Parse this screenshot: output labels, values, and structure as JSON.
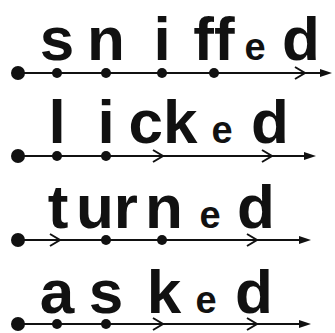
{
  "colors": {
    "ink": "#111111",
    "background": "#ffffff"
  },
  "words": [
    {
      "word": "sniffed",
      "segments": [
        {
          "text": "s",
          "size": "large",
          "marker": "dot"
        },
        {
          "text": "n",
          "size": "large",
          "marker": "dot"
        },
        {
          "text": "i",
          "size": "large",
          "marker": "dot"
        },
        {
          "text": "ff",
          "size": "large",
          "marker": "dot"
        },
        {
          "text": "e",
          "size": "small",
          "marker": "none"
        },
        {
          "text": "d",
          "size": "large",
          "marker": "chevron"
        }
      ]
    },
    {
      "word": "licked",
      "segments": [
        {
          "text": "l",
          "size": "large",
          "marker": "dot"
        },
        {
          "text": "i",
          "size": "large",
          "marker": "dot"
        },
        {
          "text": "ck",
          "size": "large",
          "marker": "chevron"
        },
        {
          "text": "e",
          "size": "small",
          "marker": "none"
        },
        {
          "text": "d",
          "size": "large",
          "marker": "chevron"
        }
      ]
    },
    {
      "word": "turned",
      "segments": [
        {
          "text": "t",
          "size": "large",
          "marker": "chevron"
        },
        {
          "text": "ur",
          "size": "large",
          "marker": "dot"
        },
        {
          "text": "n",
          "size": "large",
          "marker": "dot"
        },
        {
          "text": "e",
          "size": "small",
          "marker": "none"
        },
        {
          "text": "d",
          "size": "large",
          "marker": "chevron"
        }
      ]
    },
    {
      "word": "asked",
      "segments": [
        {
          "text": "a",
          "size": "large",
          "marker": "dot"
        },
        {
          "text": "s",
          "size": "large",
          "marker": "dot"
        },
        {
          "text": "k",
          "size": "large",
          "marker": "chevron"
        },
        {
          "text": "e",
          "size": "small",
          "marker": "none"
        },
        {
          "text": "d",
          "size": "large",
          "marker": "chevron"
        }
      ]
    }
  ]
}
